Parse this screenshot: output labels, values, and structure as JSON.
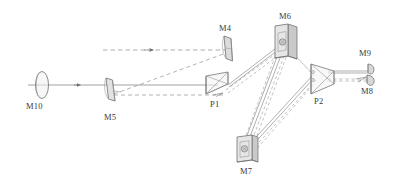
{
  "figure": {
    "kind": "optical-ray-diagram",
    "width": 393,
    "height": 188,
    "background": "#ffffff",
    "stroke_color": "#6b6b6b",
    "label_color": "#3a3a3a",
    "fill_light": "#e9e9e9",
    "fill_mid": "#d2d2d2",
    "fill_dark": "#b8b8b8"
  },
  "labels": {
    "m10": "M10",
    "m5": "M5",
    "m4": "M4",
    "p1": "P1",
    "m6": "M6",
    "m7": "M7",
    "p2": "P2",
    "m9": "M9",
    "m8": "M8"
  },
  "components": [
    {
      "id": "M10",
      "label": "M10",
      "type": "lens-ellipse",
      "x": 42,
      "y": 85
    },
    {
      "id": "M5",
      "label": "M5",
      "type": "tilted-mirror",
      "x": 110,
      "y": 90
    },
    {
      "id": "M4",
      "label": "M4",
      "type": "tilted-mirror",
      "x": 228,
      "y": 52
    },
    {
      "id": "P1",
      "label": "P1",
      "type": "prism",
      "x": 218,
      "y": 85
    },
    {
      "id": "M6",
      "label": "M6",
      "type": "mirror-plate",
      "x": 285,
      "y": 43
    },
    {
      "id": "M7",
      "label": "M7",
      "type": "mirror-plate",
      "x": 245,
      "y": 150
    },
    {
      "id": "P2",
      "label": "P2",
      "type": "prism",
      "x": 320,
      "y": 80
    },
    {
      "id": "M9",
      "label": "M9",
      "type": "small-mirror",
      "x": 371,
      "y": 72
    },
    {
      "id": "M8",
      "label": "M8",
      "type": "small-mirror",
      "x": 371,
      "y": 82
    }
  ],
  "label_positions": {
    "m10": {
      "x": 26,
      "y": 102
    },
    "m5": {
      "x": 104,
      "y": 112
    },
    "m4": {
      "x": 220,
      "y": 26
    },
    "p1": {
      "x": 210,
      "y": 100
    },
    "m6": {
      "x": 280,
      "y": 13
    },
    "m7": {
      "x": 240,
      "y": 168
    },
    "p2": {
      "x": 315,
      "y": 98
    },
    "m9": {
      "x": 360,
      "y": 51
    },
    "m8": {
      "x": 362,
      "y": 88
    }
  },
  "beams": {
    "solid_axis": {
      "from": [
        28,
        85
      ],
      "to": [
        218,
        85
      ],
      "style": "solid",
      "arrow_at": [
        78,
        85
      ]
    },
    "dashed_input": {
      "from": [
        103,
        50
      ],
      "to": [
        226,
        50
      ],
      "style": "dashed",
      "arrow_at": [
        151,
        50
      ]
    },
    "dashed_m5_to_m4": {
      "from": [
        113,
        94
      ],
      "to": [
        226,
        53
      ],
      "style": "dashed"
    },
    "dashed_m5_to_p1": {
      "from": [
        113,
        95
      ],
      "to": [
        222,
        95
      ],
      "style": "dashed"
    },
    "bundle_p1_m6": {
      "from": [
        228,
        84
      ],
      "to": [
        283,
        45
      ],
      "style": "mixed"
    },
    "bundle_m6_m7": {
      "from": [
        283,
        45
      ],
      "to": [
        247,
        147
      ],
      "style": "mixed"
    },
    "bundle_m7_p2": {
      "from": [
        247,
        147
      ],
      "to": [
        311,
        78
      ],
      "style": "mixed"
    },
    "bundle_p2_m8m9": {
      "from": [
        327,
        75
      ],
      "to": [
        368,
        75
      ],
      "style": "mixed"
    }
  }
}
